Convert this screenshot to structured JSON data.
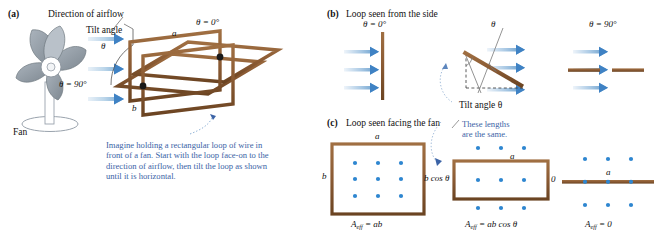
{
  "figure": {
    "colors": {
      "wire_brown": "#8a5a33",
      "wire_brown_dark": "#6b4422",
      "arrow_blue_light": "#cfe1f0",
      "arrow_blue": "#6ea3d0",
      "arrow_head_blue": "#3f82c4",
      "dot_blue": "#2e86d0",
      "note_blue": "#3b63a6",
      "fan_grey": "#9aa3ad",
      "fan_grey_dark": "#7b848e",
      "leader_grey": "#6e6e6e",
      "text_black": "#111111"
    }
  },
  "panel_a": {
    "tag": "(a)",
    "airflow_label": "Direction of airflow",
    "tilt_label": "Tilt angle",
    "theta_symbol": "θ",
    "theta_zero": "θ = 0°",
    "theta_ninety": "θ = 90°",
    "side_a": "a",
    "side_b": "b",
    "fan_label": "Fan",
    "note": "Imagine holding a rectangular loop of wire in front of a fan. Start with the loop face-on to the direction of airflow, then tilt the loop as shown until it is horizontal.",
    "note_lines": [
      "Imagine holding a rectangular loop of wire in",
      "front of a fan. Start with the loop face-on to the",
      "direction of airflow, then tilt the loop as shown",
      "until it is horizontal."
    ],
    "arrow_count": 3
  },
  "panel_b": {
    "tag": "(b)",
    "heading": "Loop seen from the side",
    "views": [
      {
        "name": "face-on",
        "label": "θ = 0°",
        "orientation": "vertical-bar"
      },
      {
        "name": "tilted",
        "label": "θ",
        "orientation": "tilted-bar",
        "tilt_caption": "Tilt angle θ"
      },
      {
        "name": "edge-on",
        "label": "θ = 90°",
        "orientation": "horizontal-bar"
      }
    ],
    "arrow_count": 3
  },
  "panel_c": {
    "tag": "(c)",
    "heading": "Loop seen facing the fan",
    "callout_lines": [
      "These lengths",
      "are the same."
    ],
    "callout": "These lengths are the same.",
    "views": [
      {
        "name": "face-on",
        "top_label": "a",
        "left_label": "b",
        "area_prefix": "A",
        "area_sub": "eff",
        "area_eq": "= ab",
        "area_full": "A_eff = ab",
        "dot_rows": 3,
        "dot_cols": 3
      },
      {
        "name": "tilted",
        "top_label": "a",
        "left_label": "b cos θ",
        "area_prefix": "A",
        "area_sub": "eff",
        "area_eq": "= ab cos θ",
        "area_full": "A_eff = ab cos θ",
        "dot_rows": 3,
        "dot_cols": 3
      },
      {
        "name": "edge-on",
        "top_label": "a",
        "left_label": "0",
        "area_prefix": "A",
        "area_sub": "eff",
        "area_eq": "= 0",
        "area_full": "A_eff = 0",
        "dot_rows": 3,
        "dot_cols": 3
      }
    ]
  }
}
